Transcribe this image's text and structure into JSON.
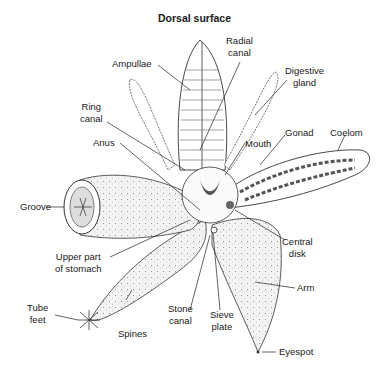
{
  "title": "Dorsal surface",
  "labels": {
    "ampullae": "Ampullae",
    "radial_canal_1": "Radial",
    "radial_canal_2": "canal",
    "digestive_gland_1": "Digestive",
    "digestive_gland_2": "gland",
    "ring_canal_1": "Ring",
    "ring_canal_2": "canal",
    "anus": "Anus",
    "mouth": "Mouth",
    "gonad": "Gonad",
    "coelom": "Coelom",
    "groove": "Groove",
    "central_disk_1": "Central",
    "central_disk_2": "disk",
    "upper_stomach_1": "Upper part",
    "upper_stomach_2": "of stomach",
    "arm": "Arm",
    "tube_feet_1": "Tube",
    "tube_feet_2": "feet",
    "spines": "Spines",
    "stone_canal_1": "Stone",
    "stone_canal_2": "canal",
    "sieve_plate_1": "Sieve",
    "sieve_plate_2": "plate",
    "eyespot": "Eyespot"
  },
  "colors": {
    "line": "#2a2a2a",
    "stipple_fill": "#f1f1f1",
    "dark_tissue": "#555555"
  }
}
